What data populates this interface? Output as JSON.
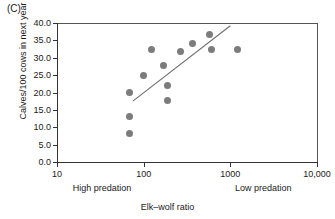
{
  "panel": {
    "label": "(C)"
  },
  "chart_data": {
    "type": "scatter",
    "title": "",
    "xlabel": "Elk–wolf ratio",
    "ylabel": "Calves/100 cows in next year",
    "xscale": "log",
    "xlim": [
      10,
      10000
    ],
    "ylim": [
      0.0,
      40.0
    ],
    "grid": false,
    "legend": null,
    "xticks": [
      {
        "value": 10,
        "label": "10"
      },
      {
        "value": 100,
        "label": "100"
      },
      {
        "value": 1000,
        "label": "1000"
      },
      {
        "value": 10000,
        "label": "10,000"
      }
    ],
    "yticks": [
      {
        "value": 0.0,
        "label": "0.0"
      },
      {
        "value": 5.0,
        "label": "5.0"
      },
      {
        "value": 10.0,
        "label": "10.0"
      },
      {
        "value": 15.0,
        "label": "15.0"
      },
      {
        "value": 20.0,
        "label": "20.0"
      },
      {
        "value": 25.0,
        "label": "25.0"
      },
      {
        "value": 30.0,
        "label": "30.0"
      },
      {
        "value": 35.0,
        "label": "35.0"
      },
      {
        "value": 40.0,
        "label": "40.0"
      }
    ],
    "annotations": [
      {
        "text": "High predation",
        "x": 33,
        "position": "below-axis-left"
      },
      {
        "text": "Low predation",
        "x": 2400,
        "position": "below-axis-right"
      }
    ],
    "points": [
      {
        "x": 68,
        "y": 20.0
      },
      {
        "x": 68,
        "y": 13.2
      },
      {
        "x": 68,
        "y": 8.2
      },
      {
        "x": 100,
        "y": 25.0
      },
      {
        "x": 122,
        "y": 32.4
      },
      {
        "x": 170,
        "y": 27.9
      },
      {
        "x": 190,
        "y": 22.0
      },
      {
        "x": 190,
        "y": 17.8
      },
      {
        "x": 265,
        "y": 31.8
      },
      {
        "x": 370,
        "y": 34.1
      },
      {
        "x": 570,
        "y": 36.8
      },
      {
        "x": 600,
        "y": 32.3
      },
      {
        "x": 1200,
        "y": 32.4
      }
    ],
    "trendline": {
      "type": "linear-in-log-x",
      "x_start": 75,
      "y_start": 17.5,
      "x_end": 1000,
      "y_end": 39.2
    },
    "colors": {
      "point": "#7c7c7c",
      "trendline": "#6e6e6e",
      "axis": "#333333"
    }
  }
}
